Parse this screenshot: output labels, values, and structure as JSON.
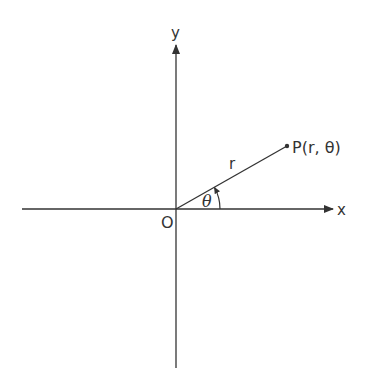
{
  "diagram": {
    "axis_x_label": "x",
    "axis_y_label": "y",
    "origin_label": "O",
    "point_label": "P(r, θ)",
    "radius_label": "r",
    "angle_label": "θ",
    "line_color": "#333333",
    "background": "#ffffff"
  }
}
